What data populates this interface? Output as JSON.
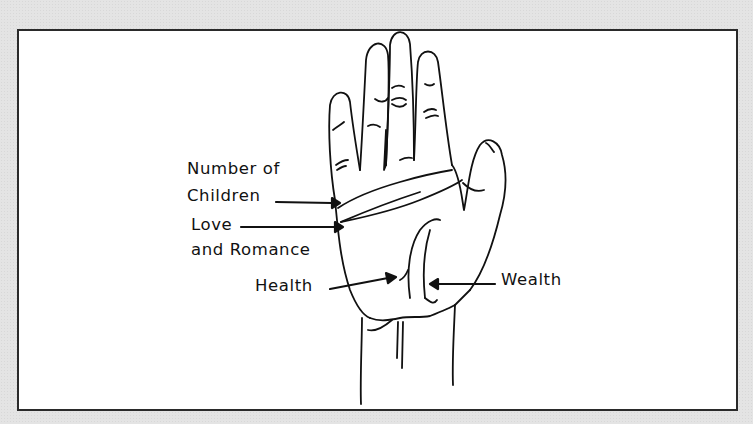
{
  "diagram": {
    "labels": {
      "number_of_children_line1": "Number of",
      "number_of_children_line2": "Children",
      "love_line1": "Love",
      "love_line2": "and Romance",
      "health": "Health",
      "wealth": "Wealth"
    },
    "colors": {
      "background": "#e4e4e4",
      "panel": "#ffffff",
      "ink": "#111111"
    }
  }
}
